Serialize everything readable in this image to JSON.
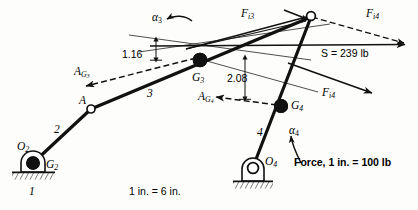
{
  "figure": {
    "type": "mechanism-force-analysis-diagram",
    "scale_length_note": "1 in. = 6 in.",
    "scale_force_note": "Force, 1 in. = 100 lb"
  },
  "links": {
    "ground_label": "1",
    "crank_label": "2",
    "coupler_label": "3",
    "rocker_label": "4"
  },
  "joints": {
    "o2": "O",
    "o2_sub": "2",
    "o4": "O",
    "o4_sub": "4",
    "a": "A"
  },
  "mass_centers": {
    "g2": "G",
    "g2_sub": "2",
    "g3": "G",
    "g3_sub": "3",
    "g4": "G",
    "g4_sub": "4"
  },
  "accelerations": {
    "ag3": "A",
    "ag3_sub": "G",
    "ag3_sub2": "3",
    "ag4": "A",
    "ag4_sub": "G",
    "ag4_sub2": "4"
  },
  "angular": {
    "alpha3": "α",
    "alpha3_sub": "3",
    "alpha4": "α",
    "alpha4_sub": "4"
  },
  "forces": {
    "fi3": "F",
    "fi3_sub": "i3",
    "fi4_upper": "F",
    "fi4_upper_sub": "i4",
    "fi4_lower": "F",
    "fi4_lower_sub": "i4",
    "shaking": "S = 239 lb"
  },
  "dimensions": {
    "d116": "1.16",
    "d208": "2.08"
  },
  "colors": {
    "ink": "#111111",
    "thin": "#2b2b2b",
    "paper": "#fdfdfb"
  }
}
